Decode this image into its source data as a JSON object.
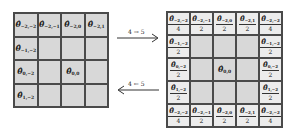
{
  "left_grid": {
    "size": "4x4",
    "cells": [
      {
        "hat": "θ̂",
        "sub": "−2,−2"
      },
      {
        "hat": "θ̂",
        "sub": "−2,−1"
      },
      {
        "hat": "θ̂",
        "sub": "−2,0"
      },
      {
        "hat": "θ̂",
        "sub": "−2,1"
      },
      {
        "hat": "θ̂",
        "sub": "−1,−2"
      },
      {
        "hat": "",
        "sub": ""
      },
      {
        "hat": "",
        "sub": ""
      },
      {
        "hat": "",
        "sub": ""
      },
      {
        "hat": "θ̂",
        "sub": "0,−2"
      },
      {
        "hat": "",
        "sub": ""
      },
      {
        "hat": "θ̂",
        "sub": "0,0"
      },
      {
        "hat": "",
        "sub": ""
      },
      {
        "hat": "θ̂",
        "sub": "1,−2"
      },
      {
        "hat": "",
        "sub": ""
      },
      {
        "hat": "",
        "sub": ""
      },
      {
        "hat": "",
        "sub": ""
      }
    ]
  },
  "right_grid": {
    "size": "5x5",
    "cells": [
      {
        "hat": "θ̂",
        "sub": "−2,−2",
        "den": "4"
      },
      {
        "hat": "θ̂",
        "sub": "−2,−1",
        "den": "2"
      },
      {
        "hat": "θ̂",
        "sub": "−2,0",
        "den": "2"
      },
      {
        "hat": "θ̂",
        "sub": "−2,1",
        "den": "2"
      },
      {
        "hat": "θ̂",
        "sub": "−2,−2",
        "den": "4"
      },
      {
        "hat": "θ̂",
        "sub": "−1,−2",
        "den": "2"
      },
      {
        "hat": "",
        "sub": "",
        "den": ""
      },
      {
        "hat": "",
        "sub": "",
        "den": ""
      },
      {
        "hat": "",
        "sub": "",
        "den": ""
      },
      {
        "hat": "θ̂",
        "sub": "−1,−2",
        "den": "2"
      },
      {
        "hat": "θ̂",
        "sub": "0,−2",
        "den": "2"
      },
      {
        "hat": "",
        "sub": "",
        "den": ""
      },
      {
        "hat": "θ̂",
        "sub": "0,0",
        "den": ""
      },
      {
        "hat": "",
        "sub": "",
        "den": ""
      },
      {
        "hat": "θ̂",
        "sub": "0,−2",
        "den": "2"
      },
      {
        "hat": "θ̂",
        "sub": "1,−2",
        "den": "2"
      },
      {
        "hat": "",
        "sub": "",
        "den": ""
      },
      {
        "hat": "",
        "sub": "",
        "den": ""
      },
      {
        "hat": "",
        "sub": "",
        "den": ""
      },
      {
        "hat": "θ̂",
        "sub": "1,−2",
        "den": "2"
      },
      {
        "hat": "θ̂",
        "sub": "−2,−2",
        "den": "4"
      },
      {
        "hat": "θ̂",
        "sub": "−2,−1",
        "den": "2"
      },
      {
        "hat": "θ̂",
        "sub": "−2,0",
        "den": "2"
      },
      {
        "hat": "θ̂",
        "sub": "−2,1",
        "den": "2"
      },
      {
        "hat": "θ̂",
        "sub": "−2,−2",
        "den": "4"
      }
    ]
  },
  "arrows": {
    "forward": {
      "label": "4 → 5",
      "direction": "right"
    },
    "backward": {
      "label": "4 ← 5",
      "direction": "left"
    }
  },
  "colors": {
    "grid_line": "#4a4a4a",
    "cell_fill": "#d8d8d8",
    "border_cell_fill": "#ececec",
    "arrow": "#333333"
  }
}
